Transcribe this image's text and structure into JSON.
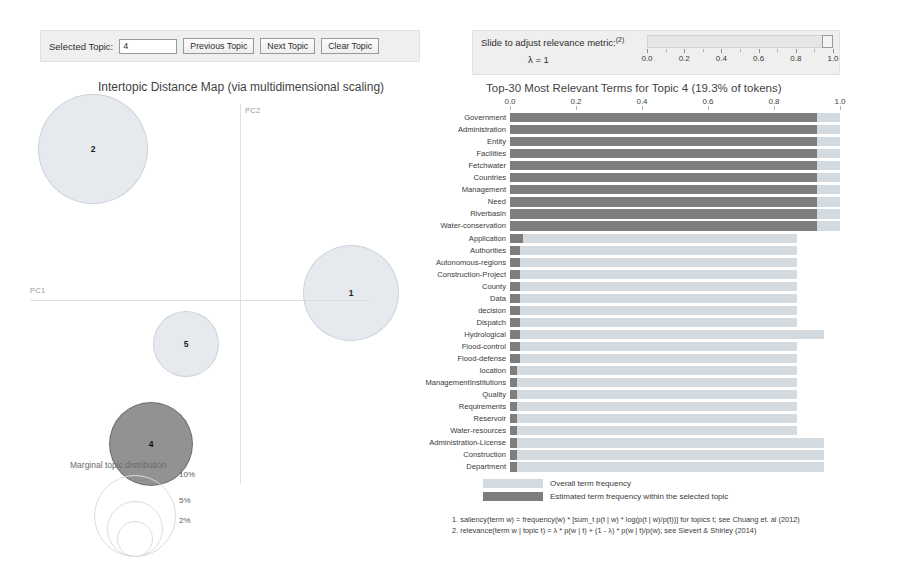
{
  "topic_controls": {
    "label": "Selected Topic:",
    "selected_topic": "4",
    "previous_label": "Previous Topic",
    "next_label": "Next Topic",
    "clear_label": "Clear Topic"
  },
  "relevance_slider": {
    "label": "Slide to adjust relevance metric:",
    "footnote_marker": "(2)",
    "lambda_text": "λ = 1",
    "value": 1.0,
    "min": 0.0,
    "max": 1.0,
    "ticks": [
      "0.0",
      "0.2",
      "0.4",
      "0.6",
      "0.8",
      "1.0"
    ]
  },
  "map": {
    "title": "Intertopic Distance Map (via multidimensional scaling)",
    "x_axis_label": "PC1",
    "y_axis_label": "PC2",
    "topics": [
      {
        "id": "2",
        "x": 62,
        "y": 48,
        "r": 54,
        "selected": false
      },
      {
        "id": "1",
        "x": 320,
        "y": 192,
        "r": 47,
        "selected": false
      },
      {
        "id": "5",
        "x": 155,
        "y": 243,
        "r": 32,
        "selected": false
      },
      {
        "id": "4",
        "x": 120,
        "y": 343,
        "r": 41,
        "selected": true
      }
    ],
    "marginal_legend": {
      "title": "Marginal topic distribution",
      "sizes": [
        {
          "label": "2%",
          "r": 17
        },
        {
          "label": "5%",
          "r": 27
        },
        {
          "label": "10%",
          "r": 40
        }
      ]
    }
  },
  "bar_chart": {
    "title": "Top-30 Most Relevant Terms for Topic 4 (19.3% of tokens)",
    "legend": {
      "overall": "Overall term frequency",
      "selected": "Estimated term frequency within the selected topic"
    },
    "footnotes": [
      "1. saliency(term w) = frequency(w) * [sum_t p(t | w) * log(p(t | w)/p(t))] for topics t; see Chuang et. al (2012)",
      "2. relevance(term w | topic t) = λ * p(w | t) + (1 - λ) * p(w | t)/p(w); see Sievert & Shirley (2014)"
    ]
  },
  "chart_data": {
    "type": "bar",
    "title": "Top-30 Most Relevant Terms for Topic 4 (19.3% of tokens)",
    "xlabel": "",
    "ylabel": "",
    "xlim": [
      0.0,
      1.0
    ],
    "xticks": [
      "0.0",
      "0.2",
      "0.4",
      "0.6",
      "0.8",
      "1.0"
    ],
    "grid": false,
    "legend_position": "bottom",
    "orientation": "horizontal",
    "categories": [
      "Government",
      "Administration",
      "Entity",
      "Facilities",
      "Fetchwater",
      "Countries",
      "Management",
      "Need",
      "Riverbasin",
      "Water-conservation",
      "Application",
      "Authorities",
      "Autonomous-regions",
      "Construction-Project",
      "County",
      "Data",
      "decision",
      "Dispatch",
      "Hydrological",
      "Flood-control",
      "Flood-defense",
      "location",
      "ManagementInstitutions",
      "Quality",
      "Requirements",
      "Reservoir",
      "Water-resources",
      "Administration-License",
      "Construction",
      "Department"
    ],
    "series": [
      {
        "name": "Overall term frequency",
        "color": "#d3dae0",
        "values": [
          1.0,
          1.0,
          1.0,
          1.0,
          1.0,
          1.0,
          1.0,
          1.0,
          1.0,
          1.0,
          0.87,
          0.87,
          0.87,
          0.87,
          0.87,
          0.87,
          0.87,
          0.87,
          0.95,
          0.87,
          0.87,
          0.87,
          0.87,
          0.87,
          0.87,
          0.87,
          0.87,
          0.95,
          0.95,
          0.95
        ]
      },
      {
        "name": "Estimated term frequency within the selected topic",
        "color": "#7d7d7d",
        "values": [
          0.93,
          0.93,
          0.93,
          0.93,
          0.93,
          0.93,
          0.93,
          0.93,
          0.93,
          0.93,
          0.04,
          0.03,
          0.03,
          0.03,
          0.03,
          0.03,
          0.03,
          0.03,
          0.03,
          0.03,
          0.03,
          0.02,
          0.02,
          0.02,
          0.02,
          0.02,
          0.02,
          0.02,
          0.02,
          0.02
        ]
      }
    ]
  }
}
